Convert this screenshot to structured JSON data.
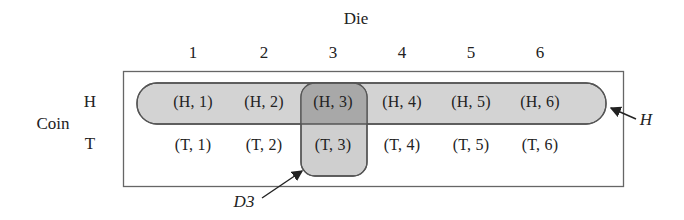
{
  "title": "Die",
  "row_axis_label": "Coin",
  "columns": [
    "1",
    "2",
    "3",
    "4",
    "5",
    "6"
  ],
  "rows": [
    "H",
    "T"
  ],
  "cells": {
    "H": [
      "(H, 1)",
      "(H, 2)",
      "(H, 3)",
      "(H, 4)",
      "(H, 5)",
      "(H, 6)"
    ],
    "T": [
      "(T, 1)",
      "(T, 2)",
      "(T, 3)",
      "(T, 4)",
      "(T, 5)",
      "(T, 6)"
    ]
  },
  "events": {
    "H": {
      "label": "H",
      "description": "Coin shows heads"
    },
    "D3": {
      "label": "D3",
      "description": "Die shows 3"
    }
  },
  "colors": {
    "pill_fill": "#d2d2d2",
    "intersection_fill": "#a9a9a9",
    "outline": "#555555"
  }
}
